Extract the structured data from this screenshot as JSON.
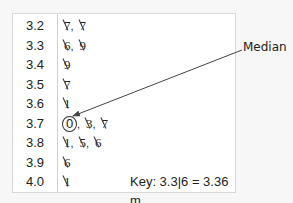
{
  "chart_data": {
    "type": "table",
    "stems": [
      "3.2",
      "3.3",
      "3.4",
      "3.5",
      "3.6",
      "3.7",
      "3.8",
      "3.9",
      "4.0"
    ],
    "leaves": [
      [
        "7",
        "7"
      ],
      [
        "6",
        "9"
      ],
      [
        "9"
      ],
      [
        "7"
      ],
      [
        "1"
      ],
      [
        "0",
        "3",
        "7"
      ],
      [
        "1",
        "5",
        "6"
      ],
      [
        "6"
      ],
      [
        "1"
      ]
    ],
    "values_m": [
      3.27,
      3.27,
      3.36,
      3.39,
      3.49,
      3.57,
      3.61,
      3.7,
      3.73,
      3.77,
      3.81,
      3.85,
      3.86,
      3.96,
      4.01
    ],
    "median": 3.7,
    "median_annotation": "Median",
    "key": "Key: 3.3|6 = 3.36 m"
  },
  "plot": {
    "rows": [
      {
        "stem": "3.2",
        "leaves": [
          {
            "v": "7",
            "ticked": true
          },
          {
            "v": "7",
            "ticked": true
          }
        ]
      },
      {
        "stem": "3.3",
        "leaves": [
          {
            "v": "6",
            "ticked": true
          },
          {
            "v": "9",
            "ticked": true
          }
        ]
      },
      {
        "stem": "3.4",
        "leaves": [
          {
            "v": "9",
            "ticked": true
          }
        ]
      },
      {
        "stem": "3.5",
        "leaves": [
          {
            "v": "7",
            "ticked": true
          }
        ]
      },
      {
        "stem": "3.6",
        "leaves": [
          {
            "v": "1",
            "ticked": true
          }
        ]
      },
      {
        "stem": "3.7",
        "leaves": [
          {
            "v": "0",
            "circled": true
          },
          {
            "v": "3",
            "ticked": true
          },
          {
            "v": "7",
            "ticked": true
          }
        ]
      },
      {
        "stem": "3.8",
        "leaves": [
          {
            "v": "1",
            "ticked": true
          },
          {
            "v": "5",
            "ticked": true
          },
          {
            "v": "6",
            "ticked": true
          }
        ]
      },
      {
        "stem": "3.9",
        "leaves": [
          {
            "v": "6",
            "ticked": true
          }
        ]
      },
      {
        "stem": "4.0",
        "leaves": [
          {
            "v": "1",
            "ticked": true
          }
        ]
      }
    ],
    "separator": ",",
    "key": "Key: 3.3|6 = 3.36 m"
  },
  "annotation": {
    "label": "Median"
  },
  "colors": {
    "text": "#222222",
    "border": "#d9d9d9",
    "background": "#f7f7f7",
    "box": "#ffffff",
    "arrow": "#444444"
  }
}
